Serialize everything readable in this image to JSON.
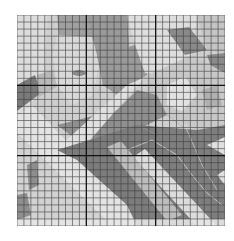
{
  "figure": {
    "grid": {
      "cells_x": 30,
      "cells_y": 30,
      "major_every": 10,
      "minor_line_color": "#3a3a3a",
      "major_line_color": "#111111"
    },
    "palette": {
      "light": "#d6d6d6",
      "lighter": "#e4e4e4",
      "mid": "#a9a9a9",
      "midlight": "#bdbdbd",
      "dark": "#7d7d7d",
      "darker": "#6a6a6a",
      "background": "#ffffff"
    }
  }
}
